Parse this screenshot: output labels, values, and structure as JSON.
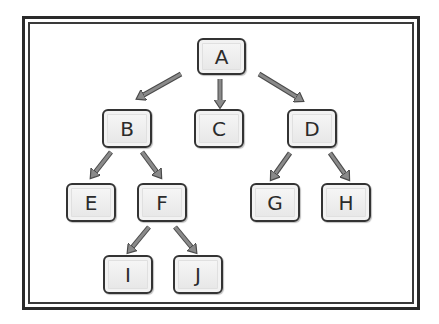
{
  "diagram": {
    "type": "tree",
    "nodes": [
      {
        "id": "A",
        "label": "A",
        "x": 197,
        "y": 38,
        "w": 49,
        "h": 37
      },
      {
        "id": "B",
        "label": "B",
        "x": 102,
        "y": 109,
        "w": 50,
        "h": 39
      },
      {
        "id": "C",
        "label": "C",
        "x": 194,
        "y": 109,
        "w": 50,
        "h": 39
      },
      {
        "id": "D",
        "label": "D",
        "x": 287,
        "y": 109,
        "w": 50,
        "h": 39
      },
      {
        "id": "E",
        "label": "E",
        "x": 66,
        "y": 183,
        "w": 50,
        "h": 39
      },
      {
        "id": "F",
        "label": "F",
        "x": 137,
        "y": 183,
        "w": 50,
        "h": 39
      },
      {
        "id": "G",
        "label": "G",
        "x": 250,
        "y": 183,
        "w": 50,
        "h": 39
      },
      {
        "id": "H",
        "label": "H",
        "x": 321,
        "y": 183,
        "w": 50,
        "h": 39
      },
      {
        "id": "I",
        "label": "I",
        "x": 103,
        "y": 255,
        "w": 50,
        "h": 39
      },
      {
        "id": "J",
        "label": "J",
        "x": 173,
        "y": 255,
        "w": 50,
        "h": 39
      }
    ],
    "edges": [
      {
        "from": "A",
        "to": "B",
        "x1": 181,
        "y1": 74,
        "x2": 140,
        "y2": 97
      },
      {
        "from": "A",
        "to": "C",
        "x1": 220,
        "y1": 79,
        "x2": 220,
        "y2": 104
      },
      {
        "from": "A",
        "to": "D",
        "x1": 259,
        "y1": 74,
        "x2": 300,
        "y2": 99
      },
      {
        "from": "B",
        "to": "E",
        "x1": 111,
        "y1": 152,
        "x2": 93,
        "y2": 175
      },
      {
        "from": "B",
        "to": "F",
        "x1": 142,
        "y1": 152,
        "x2": 159,
        "y2": 175
      },
      {
        "from": "D",
        "to": "G",
        "x1": 290,
        "y1": 153,
        "x2": 273,
        "y2": 177
      },
      {
        "from": "D",
        "to": "H",
        "x1": 330,
        "y1": 153,
        "x2": 347,
        "y2": 177
      },
      {
        "from": "F",
        "to": "I",
        "x1": 149,
        "y1": 227,
        "x2": 130,
        "y2": 250
      },
      {
        "from": "F",
        "to": "J",
        "x1": 175,
        "y1": 227,
        "x2": 194,
        "y2": 250
      }
    ],
    "colors": {
      "arrow_fill": "#8a8a8a",
      "arrow_stroke": "#4a4a4a",
      "node_border": "#333333",
      "frame": "#2a2a2a"
    }
  }
}
